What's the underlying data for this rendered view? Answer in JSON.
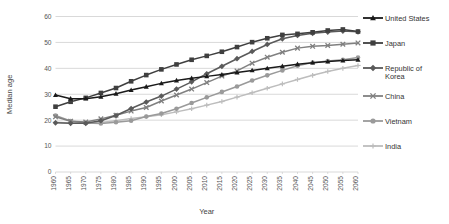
{
  "chart_data": {
    "type": "line",
    "title": "",
    "xlabel": "Year",
    "ylabel": "Median age",
    "ylim": [
      0,
      60
    ],
    "ytick_step": 10,
    "yticks": [
      "0",
      "10",
      "20",
      "30",
      "40",
      "50",
      "60"
    ],
    "grid": true,
    "legend_position": "right",
    "x": [
      1960,
      1965,
      1970,
      1975,
      1980,
      1985,
      1990,
      1995,
      2000,
      2005,
      2010,
      2015,
      2020,
      2025,
      2030,
      2035,
      2040,
      2045,
      2050,
      2055,
      2060
    ],
    "categories": [
      "1960",
      "1965",
      "1970",
      "1975",
      "1980",
      "1985",
      "1990",
      "1995",
      "2000",
      "2005",
      "2010",
      "2015",
      "2020",
      "2025",
      "2030",
      "2035",
      "2040",
      "2045",
      "2050",
      "2055",
      "2060"
    ],
    "series": [
      {
        "name": "United States",
        "marker": "triangle",
        "color": "#1a1a1a",
        "values": [
          29.7,
          28.3,
          28.3,
          29.0,
          30.2,
          31.6,
          32.9,
          34.2,
          35.3,
          36.2,
          36.9,
          37.6,
          38.4,
          39.2,
          40.0,
          40.8,
          41.6,
          42.2,
          42.6,
          43.0,
          43.3
        ]
      },
      {
        "name": "Japan",
        "marker": "square",
        "color": "#3f3f3f",
        "values": [
          25.2,
          27.1,
          28.6,
          30.5,
          32.4,
          35.0,
          37.4,
          39.6,
          41.5,
          43.3,
          44.8,
          46.4,
          48.2,
          50.1,
          51.6,
          52.9,
          53.3,
          53.9,
          54.6,
          55.0,
          54.2
        ]
      },
      {
        "name": "Republic of Korea",
        "marker": "diamond",
        "color": "#5a5a5a",
        "values": [
          19.0,
          18.8,
          18.8,
          19.8,
          21.8,
          24.5,
          27.0,
          29.3,
          32.0,
          34.8,
          37.9,
          40.8,
          43.7,
          46.5,
          49.2,
          51.4,
          52.7,
          53.5,
          54.0,
          54.4,
          54.1
        ]
      },
      {
        "name": "China",
        "marker": "cross",
        "color": "#808080",
        "values": [
          21.3,
          19.6,
          19.3,
          20.5,
          21.9,
          23.5,
          24.9,
          27.4,
          29.7,
          32.0,
          34.5,
          37.0,
          39.0,
          42.0,
          44.3,
          46.2,
          47.8,
          48.5,
          48.8,
          49.3,
          49.8
        ]
      },
      {
        "name": "Vietnam",
        "marker": "circle",
        "color": "#9a9a9a",
        "values": [
          21.8,
          19.7,
          18.9,
          18.7,
          19.2,
          19.8,
          21.4,
          22.6,
          24.4,
          26.6,
          28.8,
          30.9,
          33.0,
          35.3,
          37.3,
          39.2,
          41.0,
          42.2,
          42.8,
          43.3,
          44.2
        ]
      },
      {
        "name": "India",
        "marker": "plus",
        "color": "#bdbdbd",
        "values": [
          19.2,
          18.9,
          18.8,
          19.1,
          19.8,
          20.6,
          21.3,
          22.1,
          23.2,
          24.4,
          25.8,
          27.2,
          28.9,
          30.6,
          32.3,
          34.0,
          35.7,
          37.3,
          38.8,
          40.0,
          41.1
        ]
      }
    ]
  },
  "legend": {
    "items": [
      {
        "label": "United States"
      },
      {
        "label": "Japan"
      },
      {
        "label": "Republic of Korea"
      },
      {
        "label": "China"
      },
      {
        "label": "Vietnam"
      },
      {
        "label": "India"
      }
    ]
  }
}
